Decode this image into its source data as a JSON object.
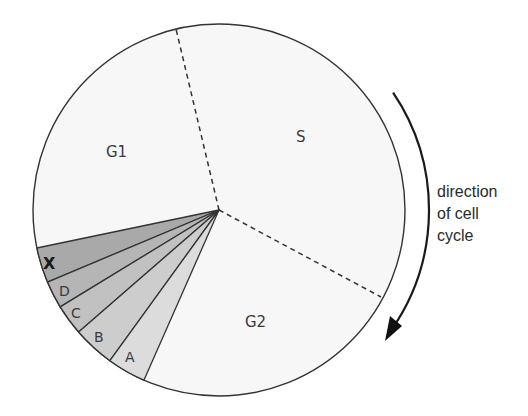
{
  "diagram": {
    "title": "Cell cycle",
    "phases": [
      {
        "id": "G1",
        "label": "G1"
      },
      {
        "id": "S",
        "label": "S"
      },
      {
        "id": "G2",
        "label": "G2"
      }
    ],
    "subsectors": [
      {
        "id": "X",
        "label": "X",
        "color": "#a9a9a9"
      },
      {
        "id": "D",
        "label": "D",
        "color": "#b5b5b5"
      },
      {
        "id": "C",
        "label": "C",
        "color": "#c1c1c1"
      },
      {
        "id": "B",
        "label": "B",
        "color": "#cdcdcd"
      },
      {
        "id": "A",
        "label": "A",
        "color": "#dcdcdc"
      }
    ],
    "pie_fill": "#f7f7f7",
    "stroke": "#333333",
    "direction_label": [
      "direction",
      "of cell",
      "cycle"
    ]
  }
}
